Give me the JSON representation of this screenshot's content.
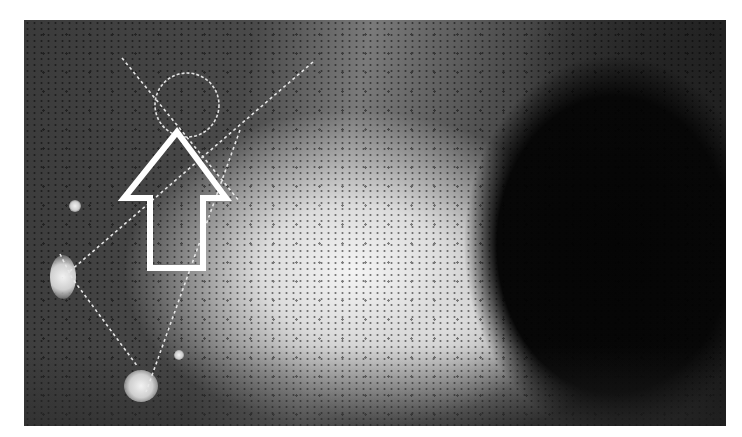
{
  "image": {
    "subject": "lunar surface photograph with crater and landing-site annotation",
    "annotations": {
      "arrow": {
        "icon": "up-arrow-outline",
        "color": "#ffffff"
      },
      "circle": {
        "icon": "dashed-circle-marker",
        "color": "#e0e0e0"
      },
      "dashed_lines": {
        "color": "#e6e6e6",
        "count": 4
      }
    },
    "colors": {
      "crater_shadow": "#050505",
      "bright_ejecta": "#f4f4f4",
      "background_regolith": "#4a4a4a",
      "frame": "#ffffff"
    }
  }
}
